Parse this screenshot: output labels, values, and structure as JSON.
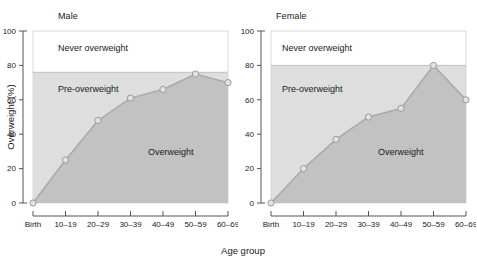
{
  "figure": {
    "xlabel": "Age group",
    "ylabel": "Overweight (%)"
  },
  "bands": {
    "never_label": "Never overweight",
    "pre_label": "Pre-overweight",
    "over_label": "Overweight"
  },
  "panels": [
    {
      "title": "Male"
    },
    {
      "title": "Female"
    }
  ],
  "chart_data": {
    "type": "line",
    "title": "",
    "xlabel": "Age group",
    "ylabel": "Overweight (%)",
    "categories": [
      "Birth",
      "10–19",
      "20–29",
      "30–39",
      "40–49",
      "50–59",
      "60–69"
    ],
    "ylim": [
      0,
      100
    ],
    "yticks": [
      0,
      20,
      40,
      60,
      80,
      100
    ],
    "ytick_labels": [
      "0",
      "20",
      "40",
      "60",
      "80",
      "100"
    ],
    "grid": false,
    "legend": "none",
    "panels": [
      {
        "name": "Male",
        "series": [
          {
            "name": "Male",
            "values": [
              0,
              25,
              48,
              61,
              66,
              75,
              70
            ]
          }
        ],
        "bands": [
          {
            "label": "Never overweight",
            "range": [
              76,
              100
            ],
            "color": "#ffffff"
          },
          {
            "label": "Pre-overweight",
            "range": [
              0,
              76
            ],
            "color": "#dedede"
          },
          {
            "label": "Overweight",
            "area_under_curve": true,
            "color": "#c2c2c2"
          }
        ],
        "threshold": 76
      },
      {
        "name": "Female",
        "series": [
          {
            "name": "Female",
            "values": [
              0,
              20,
              37,
              50,
              55,
              80,
              60
            ]
          }
        ],
        "bands": [
          {
            "label": "Never overweight",
            "range": [
              80,
              100
            ],
            "color": "#ffffff"
          },
          {
            "label": "Pre-overweight",
            "range": [
              0,
              80
            ],
            "color": "#dedede"
          },
          {
            "label": "Overweight",
            "area_under_curve": true,
            "color": "#c2c2c2"
          }
        ],
        "threshold": 80
      }
    ]
  }
}
